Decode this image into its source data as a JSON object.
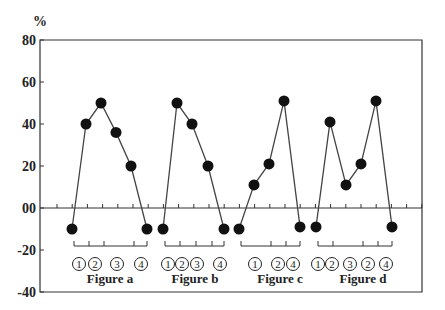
{
  "chart_data": {
    "type": "line",
    "title": "",
    "ylabel": "%",
    "xlabel": "",
    "ylim": [
      -40,
      80
    ],
    "yticks": [
      80,
      60,
      40,
      20,
      0,
      -20,
      -40
    ],
    "ytick_labels": [
      "80",
      "60",
      "40",
      "20",
      "00",
      "-20",
      "-40"
    ],
    "grid": false,
    "legend": null,
    "series": [
      {
        "name": "Figure a",
        "markers": [
          "①",
          "②",
          "",
          "③",
          "④",
          ""
        ],
        "values": [
          -10,
          40,
          50,
          36,
          20,
          -10
        ]
      },
      {
        "name": "Figure b",
        "markers": [
          "①",
          "②",
          "③",
          "④",
          ""
        ],
        "values": [
          -10,
          50,
          40,
          20,
          -10
        ]
      },
      {
        "name": "Figure c",
        "markers": [
          "",
          "①",
          "②",
          "④",
          ""
        ],
        "values": [
          -10,
          11,
          21,
          51,
          -9
        ]
      },
      {
        "name": "Figure d",
        "markers": [
          "①",
          "②",
          "③",
          "②",
          "④",
          ""
        ],
        "values": [
          -9,
          41,
          11,
          21,
          51,
          -9
        ]
      }
    ],
    "group_labels": [
      "Figure a",
      "Figure b",
      "Figure c",
      "Figure d"
    ],
    "circled_labels": {
      "a": [
        "①",
        "②",
        "③",
        "④"
      ],
      "b": [
        "①",
        "②",
        "③",
        "④"
      ],
      "c": [
        "①",
        "②",
        "④"
      ],
      "d": [
        "①",
        "②",
        "③",
        "②",
        "④"
      ]
    }
  },
  "colors": {
    "line": "#444444",
    "marker": "#111111",
    "axis": "#333333",
    "text": "#222222"
  }
}
